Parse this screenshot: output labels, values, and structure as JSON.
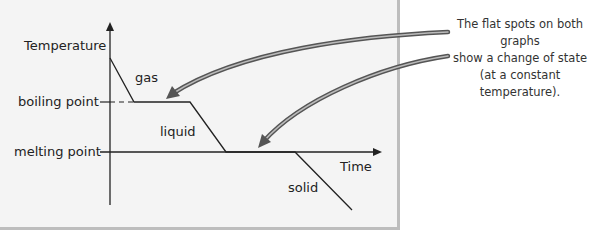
{
  "diagram": {
    "y_axis_label": "Temperature",
    "x_axis_label": "Time",
    "y_ticks": [
      "boiling point",
      "melting point"
    ],
    "region_labels": [
      "gas",
      "liquid",
      "solid"
    ],
    "annotation": {
      "lines": [
        "The flat spots on both graphs",
        "show a change of state",
        "(at a constant temperature)."
      ]
    },
    "colors": {
      "panel_background": "#f4f4f4",
      "panel_border": "#bdbdbd",
      "line": "#222222",
      "arrow": "#6b6b6b"
    }
  }
}
